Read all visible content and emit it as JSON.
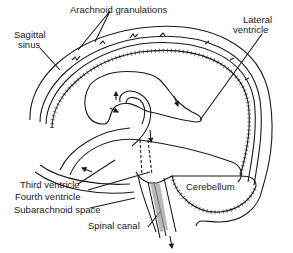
{
  "diagram": {
    "type": "anatomical-line-drawing",
    "labels": {
      "arachnoid_granulations": "Arachnoid granulations",
      "sagittal_sinus_1": "Sagittal",
      "sagittal_sinus_2": "sinus",
      "lateral_ventricle_1": "Lateral",
      "lateral_ventricle_2": "ventricle",
      "third_ventricle": "Third ventricle",
      "fourth_ventricle": "Fourth ventricle",
      "subarachnoid_space": "Subarachnoid space",
      "spinal_canal": "Spinal canal",
      "cerebellum": "Cerebellum"
    },
    "colors": {
      "line": "#1a1a1a",
      "background": "#ffffff",
      "shading": "#9a9a9a"
    }
  }
}
